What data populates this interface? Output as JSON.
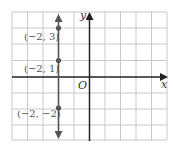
{
  "figure": {
    "type": "coordinate-plane",
    "axes": {
      "x_label": "x",
      "y_label": "y",
      "origin_label": "O",
      "x_range": [
        -5,
        5
      ],
      "y_range": [
        -4,
        4
      ]
    },
    "line": {
      "equation": "x = -2",
      "arrows": "both"
    },
    "points": [
      {
        "x": -2,
        "y": 3,
        "label": "(−2, 3)"
      },
      {
        "x": -2,
        "y": 1,
        "label": "(−2, 1)"
      },
      {
        "x": -2,
        "y": -2,
        "label": "(−2, −2)"
      }
    ],
    "colors": {
      "grid": "#c8c8c8",
      "axes": "#222222",
      "line": "#555555",
      "points": "#555555",
      "labels": "#555555"
    }
  }
}
